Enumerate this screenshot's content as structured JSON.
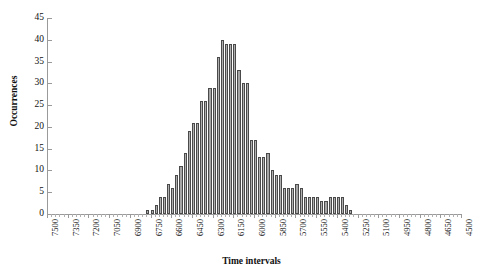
{
  "chart_data": {
    "type": "bar",
    "title": "",
    "subtitle": "",
    "xlabel": "Time intervals",
    "ylabel": "Occurrences",
    "ylim": [
      0,
      45
    ],
    "ytick_step": 5,
    "grid": false,
    "legend": null,
    "x_tick_labels": [
      "7500",
      "7350",
      "7200",
      "7050",
      "6900",
      "6750",
      "6600",
      "6450",
      "6300",
      "6150",
      "6000",
      "5850",
      "5700",
      "5550",
      "5400",
      "5250",
      "5100",
      "4950",
      "4800",
      "4650",
      "4500"
    ],
    "x_axis_direction": "descending",
    "x_bin_width": 30,
    "categories": [
      "6780",
      "6750",
      "6720",
      "6690",
      "6660",
      "6630",
      "6600",
      "6570",
      "6540",
      "6510",
      "6480",
      "6450",
      "6420",
      "6390",
      "6360",
      "6330",
      "6300",
      "6270",
      "6240",
      "6210",
      "6180",
      "6150",
      "6120",
      "6090",
      "6060",
      "6030",
      "6000",
      "5970",
      "5940",
      "5910",
      "5880",
      "5850",
      "5820",
      "5790",
      "5760",
      "5730",
      "5700",
      "5670",
      "5640",
      "5610",
      "5580",
      "5550",
      "5520",
      "5490",
      "5460",
      "5430",
      "5400",
      "5370",
      "5340",
      "5310",
      "5280",
      "5250",
      "5220",
      "5190",
      "5160",
      "5130",
      "5100",
      "5070",
      "5040",
      "5010"
    ],
    "values": [
      1,
      1,
      2,
      4,
      4,
      7,
      6,
      9,
      11,
      14,
      19,
      21,
      21,
      26,
      26,
      29,
      29,
      36,
      40,
      39,
      39,
      39,
      33,
      30,
      30,
      17,
      17,
      13,
      13,
      14,
      10,
      9,
      9,
      6,
      6,
      6,
      7,
      6,
      4,
      4,
      4,
      4,
      3,
      3,
      4,
      4,
      4,
      4,
      2,
      1,
      0,
      0,
      0,
      0,
      0,
      0,
      0,
      0,
      0,
      0
    ],
    "ytick_labels": [
      "0",
      "5",
      "10",
      "15",
      "20",
      "25",
      "30",
      "35",
      "40",
      "45"
    ],
    "bar_fill_color": "#9d9d9d",
    "bar_edge_color": "#4a4a4a",
    "axis_color": "#9a9a9a",
    "background_color": "#ffffff",
    "max_value": 40
  },
  "axes": {
    "y_title": "Occurrences",
    "x_title": "Time intervals"
  }
}
